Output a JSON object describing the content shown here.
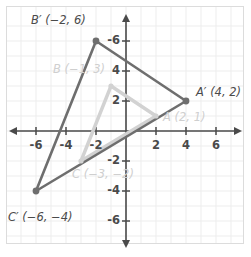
{
  "figure": {
    "type": "coordinate-plane-dilation",
    "origin_px": [
      126,
      131
    ],
    "pixels_per_unit": 15,
    "grid": true,
    "axis_range": [
      -7.6,
      7.6
    ],
    "colors": {
      "image_stroke": "#6e6e6e",
      "preimage_stroke": "#d2d2d2",
      "axis": "#4a4a4a",
      "grid": "#ededed",
      "frame": "#dcdcdc",
      "tick_label": "#4a4a4a",
      "preimage_label": "#cfcfcf"
    }
  },
  "axes": {
    "x_ticks": [
      "-6",
      "-4",
      "-2",
      "2",
      "4",
      "6"
    ],
    "x_tick_values": [
      -6,
      -4,
      -2,
      2,
      4,
      6
    ],
    "y_ticks": [
      "-6",
      "4",
      "2",
      "-2",
      "-4",
      "-6"
    ],
    "y_tick_labels": [
      "-6",
      "4",
      "2",
      "-2",
      "-4",
      "-6"
    ],
    "y_tick_values": [
      6,
      4,
      2,
      -2,
      -4,
      -6
    ]
  },
  "shapes": {
    "preimage": {
      "name": "ABC",
      "vertices": [
        {
          "id": "A",
          "label": "A (2, 1)",
          "x": 2,
          "y": 1
        },
        {
          "id": "B",
          "label": "B (−1, 3)",
          "x": -1,
          "y": 3
        },
        {
          "id": "C",
          "label": "C (−3, −2)",
          "x": -3,
          "y": -2
        }
      ]
    },
    "image": {
      "name": "A'B'C'",
      "vertices": [
        {
          "id": "A'",
          "label": "A′ (4, 2)",
          "x": 4,
          "y": 2
        },
        {
          "id": "B'",
          "label": "B′ (−2, 6)",
          "x": -2,
          "y": 6
        },
        {
          "id": "C'",
          "label": "C′ (−6, −4)",
          "x": -6,
          "y": -4
        }
      ]
    }
  },
  "chart_data": {
    "type": "scatter",
    "title": "",
    "xlabel": "",
    "ylabel": "",
    "xlim": [
      -7.6,
      7.6
    ],
    "ylim": [
      -7.6,
      7.6
    ],
    "grid": true,
    "series": [
      {
        "name": "Triangle ABC (preimage)",
        "color": "#d2d2d2",
        "closed": true,
        "points": [
          [
            2,
            1
          ],
          [
            -1,
            3
          ],
          [
            -3,
            -2
          ]
        ],
        "point_labels": [
          "A (2, 1)",
          "B (−1, 3)",
          "C (−3, −2)"
        ]
      },
      {
        "name": "Triangle A'B'C' (image)",
        "color": "#6e6e6e",
        "closed": true,
        "points": [
          [
            4,
            2
          ],
          [
            -2,
            6
          ],
          [
            -6,
            -4
          ]
        ],
        "point_labels": [
          "A′ (4, 2)",
          "B′ (−2, 6)",
          "C′ (−6, −4)"
        ]
      }
    ]
  }
}
